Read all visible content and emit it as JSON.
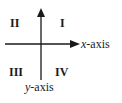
{
  "diagram": {
    "type": "coordinate-plane-quadrants",
    "quadrants": {
      "q1": "I",
      "q2": "II",
      "q3": "III",
      "q4": "IV"
    },
    "axes": {
      "x": {
        "var": "x",
        "suffix": "-axis",
        "arrow": "right"
      },
      "y": {
        "var": "y",
        "suffix": "-axis",
        "arrow": "up",
        "label_position": "bottom"
      }
    },
    "colors": {
      "ink": "#1a1a1a",
      "background": "#ffffff"
    }
  }
}
